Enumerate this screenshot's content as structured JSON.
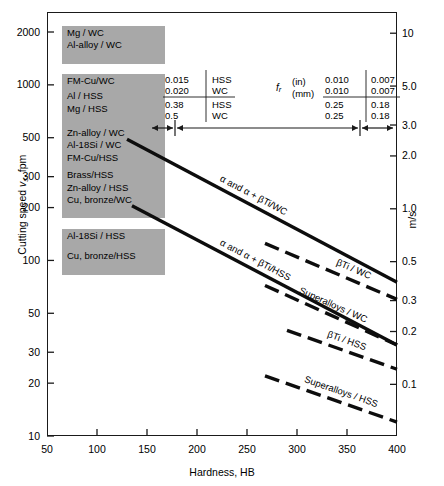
{
  "chart_data": {
    "type": "line",
    "title": "",
    "xlabel": "Hardness, HB",
    "ylabel_left": "Cutting speed v s , fpm",
    "ylabel_right": "m/s",
    "xscale": "linear",
    "yscale": "log",
    "xlim": [
      50,
      400
    ],
    "ylim": [
      10,
      2600
    ],
    "grid": false,
    "legend": "inline-annotations",
    "x_ticks": [
      50,
      100,
      150,
      200,
      250,
      300,
      350,
      400
    ],
    "y_ticks_left": [
      10,
      20,
      30,
      50,
      100,
      200,
      300,
      500,
      1000,
      2000
    ],
    "y_ticks_right_values": [
      0.1,
      0.2,
      0.3,
      0.5,
      1.0,
      2.0,
      3.0,
      5.0,
      10
    ],
    "y_ticks_right_labels": [
      "0.1",
      "0.2",
      "0.3",
      "0.5",
      "1.0",
      "2.0",
      "3.0",
      "5.0",
      "10"
    ],
    "series": [
      {
        "name": "alpha and alpha + betaTi / WC",
        "label": "α and α + βTi/WC",
        "style": "solid",
        "points": [
          [
            130,
            490
          ],
          [
            400,
            75
          ]
        ]
      },
      {
        "name": "alpha and alpha + betaTi / HSS",
        "label": "α and α + βTi/HSS",
        "style": "solid",
        "points": [
          [
            135,
            205
          ],
          [
            400,
            33
          ]
        ]
      },
      {
        "name": "betaTi / WC",
        "label": "βTi / WC",
        "style": "dashed",
        "points": [
          [
            268,
            125
          ],
          [
            400,
            60
          ]
        ]
      },
      {
        "name": "Superalloys / WC",
        "label": "Superalloys / WC",
        "style": "dashed",
        "points": [
          [
            268,
            72
          ],
          [
            400,
            33
          ]
        ]
      },
      {
        "name": "betaTi / HSS",
        "label": "βTi / HSS",
        "style": "dashed",
        "points": [
          [
            290,
            40
          ],
          [
            400,
            24
          ]
        ]
      },
      {
        "name": "Superalloys / HSS",
        "label": "Superalloys / HSS",
        "style": "dashed",
        "points": [
          [
            268,
            22
          ],
          [
            400,
            12
          ]
        ]
      }
    ],
    "material_bands": [
      {
        "lines": [
          "Mg / WC"
        ],
        "speed_top": 2000,
        "speed_bottom": 1740
      },
      {
        "lines": [
          "Al-alloy / WC"
        ],
        "speed_top": 1700,
        "speed_bottom": 1440
      },
      {
        "lines": [
          "FM-Cu/WC"
        ],
        "speed_top": 1060,
        "speed_bottom": 930
      },
      {
        "lines": [
          "Al / HSS",
          "Mg / HSS"
        ],
        "speed_top": 870,
        "speed_bottom": 640
      },
      {
        "lines": [
          "Zn-alloy / WC",
          "Al-18Si / WC",
          "FM-Cu/HSS"
        ],
        "speed_top": 540,
        "speed_bottom": 350
      },
      {
        "lines": [
          "Brass/HSS",
          "Zn-alloy / HSS",
          "Cu, bronze/WC"
        ],
        "speed_top": 310,
        "speed_bottom": 190
      },
      {
        "lines": [
          "Al-18Si / HSS"
        ],
        "speed_top": 140,
        "speed_bottom": 118
      },
      {
        "lines": [
          "Cu, bronze/HSS"
        ],
        "speed_top": 108,
        "speed_bottom": 90
      }
    ],
    "feed_rate_table": {
      "symbol": "f",
      "symbol_sub": "r",
      "unit_rows": [
        "(in)",
        "(mm)"
      ],
      "left_group": {
        "in": [
          "0.015",
          "0.020"
        ],
        "mm": [
          "0.38",
          "0.5"
        ],
        "tools": [
          "HSS",
          "WC",
          "HSS",
          "WC"
        ]
      },
      "right_group_a": {
        "in": [
          "0.010",
          "0.010"
        ],
        "mm": [
          "0.25",
          "0.25"
        ]
      },
      "right_group_b": {
        "in": [
          "0.007",
          "0.007"
        ],
        "mm": [
          "0.18",
          "0.18"
        ]
      }
    }
  },
  "colors": {
    "band_gray": "#a8a8a8",
    "ink": "#1a1a1a",
    "background": "#ffffff"
  }
}
